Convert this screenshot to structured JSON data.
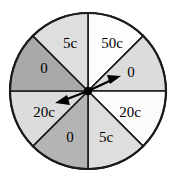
{
  "figure": {
    "name": "spinner-wheel",
    "type": "probability-spinner",
    "sector_count": 8,
    "background_color": "#ffffff",
    "outline_color": "#1a1a1a",
    "pointer_count": 2
  },
  "wheel": {
    "center_x": 88,
    "center_y": 91,
    "radius": 78,
    "sectors": [
      {
        "label": "50c",
        "start_deg": 0,
        "end_deg": 45,
        "fill": "#fdfdfd",
        "label_x": 112,
        "label_y": 45
      },
      {
        "label": "0",
        "start_deg": 45,
        "end_deg": 90,
        "fill": "#dcdcdc",
        "label_x": 131,
        "label_y": 74
      },
      {
        "label": "20c",
        "start_deg": 90,
        "end_deg": 135,
        "fill": "#fbfbfb",
        "label_x": 130,
        "label_y": 114
      },
      {
        "label": "5c",
        "start_deg": 135,
        "end_deg": 180,
        "fill": "#dedede",
        "label_x": 106,
        "label_y": 139
      },
      {
        "label": "0",
        "start_deg": 180,
        "end_deg": 225,
        "fill": "#b4b4b4",
        "label_x": 70,
        "label_y": 139
      },
      {
        "label": "20c",
        "start_deg": 225,
        "end_deg": 270,
        "fill": "#dcdcdc",
        "label_x": 44,
        "label_y": 114
      },
      {
        "label": "0",
        "start_deg": 270,
        "end_deg": 315,
        "fill": "#a9a9a9",
        "label_x": 44,
        "label_y": 70
      },
      {
        "label": "5c",
        "start_deg": 315,
        "end_deg": 360,
        "fill": "#dedede",
        "label_x": 70,
        "label_y": 45
      }
    ]
  },
  "pointers": [
    {
      "name": "pointer-upper-right",
      "tip_x": 120,
      "tip_y": 77,
      "points_to_label": "0",
      "color": "#000000"
    },
    {
      "name": "pointer-lower-left",
      "tip_x": 56,
      "tip_y": 103,
      "points_to_label": "20c",
      "color": "#000000"
    }
  ],
  "hub": {
    "name": "spinner-hub",
    "x": 88,
    "y": 91,
    "radius": 4,
    "color": "#000000"
  }
}
